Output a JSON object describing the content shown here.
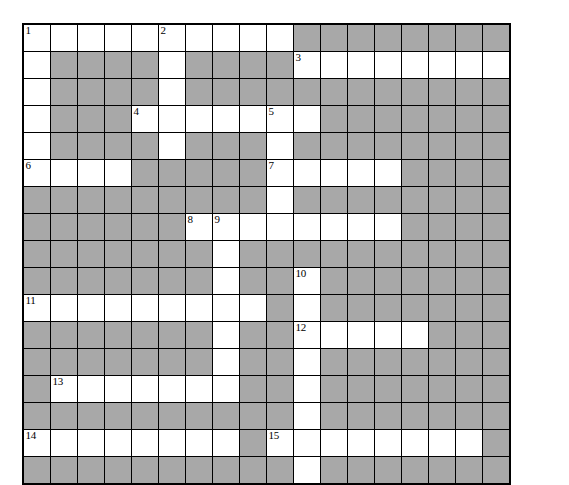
{
  "document": {
    "type": "crossword-puzzle-grid",
    "title": "Crossword Puzzle Grid"
  },
  "grid": {
    "columns": 18,
    "rows": 14,
    "cell_size_px": 28,
    "colors": {
      "empty_cell": "#ffffff",
      "block_cell": "#a8a8a8",
      "border": "#000000",
      "number_text": "#000000",
      "page_background": "#ffffff"
    },
    "legend": {
      "W": "white answer cell",
      "B": "shaded block cell"
    },
    "cells": [
      [
        "W",
        "W",
        "W",
        "W",
        "W",
        "W",
        "W",
        "W",
        "W",
        "W",
        "B",
        "B",
        "B",
        "B",
        "B",
        "B",
        "B",
        "B"
      ],
      [
        "W",
        "B",
        "B",
        "B",
        "B",
        "W",
        "B",
        "B",
        "B",
        "B",
        "W",
        "W",
        "W",
        "W",
        "W",
        "W",
        "W",
        "W"
      ],
      [
        "W",
        "B",
        "B",
        "B",
        "B",
        "W",
        "B",
        "B",
        "B",
        "B",
        "B",
        "B",
        "B",
        "B",
        "B",
        "B",
        "B",
        "B"
      ],
      [
        "W",
        "B",
        "B",
        "B",
        "W",
        "W",
        "W",
        "W",
        "W",
        "W",
        "W",
        "B",
        "B",
        "B",
        "B",
        "B",
        "B",
        "B"
      ],
      [
        "W",
        "B",
        "B",
        "B",
        "B",
        "W",
        "B",
        "B",
        "B",
        "W",
        "B",
        "B",
        "B",
        "B",
        "B",
        "B",
        "B",
        "B"
      ],
      [
        "W",
        "W",
        "W",
        "W",
        "B",
        "B",
        "B",
        "B",
        "B",
        "W",
        "W",
        "W",
        "W",
        "W",
        "B",
        "B",
        "B",
        "B"
      ],
      [
        "B",
        "B",
        "B",
        "B",
        "B",
        "B",
        "B",
        "B",
        "B",
        "W",
        "B",
        "B",
        "B",
        "B",
        "B",
        "B",
        "B",
        "B"
      ],
      [
        "B",
        "B",
        "B",
        "B",
        "B",
        "B",
        "W",
        "W",
        "W",
        "W",
        "W",
        "W",
        "W",
        "W",
        "B",
        "B",
        "B",
        "B"
      ],
      [
        "B",
        "B",
        "B",
        "B",
        "B",
        "B",
        "B",
        "W",
        "B",
        "B",
        "B",
        "B",
        "B",
        "B",
        "B",
        "B",
        "B",
        "B"
      ],
      [
        "B",
        "B",
        "B",
        "B",
        "B",
        "B",
        "B",
        "W",
        "B",
        "B",
        "W",
        "B",
        "B",
        "B",
        "B",
        "B",
        "B",
        "B"
      ],
      [
        "W",
        "W",
        "W",
        "W",
        "W",
        "W",
        "W",
        "W",
        "W",
        "B",
        "W",
        "B",
        "B",
        "B",
        "B",
        "B",
        "B",
        "B"
      ],
      [
        "B",
        "B",
        "B",
        "B",
        "B",
        "B",
        "B",
        "W",
        "B",
        "B",
        "W",
        "W",
        "W",
        "W",
        "W",
        "B",
        "B",
        "B"
      ],
      [
        "B",
        "B",
        "B",
        "B",
        "B",
        "B",
        "B",
        "W",
        "B",
        "B",
        "W",
        "B",
        "B",
        "B",
        "B",
        "B",
        "B",
        "B"
      ],
      [
        "B",
        "W",
        "W",
        "W",
        "W",
        "W",
        "W",
        "W",
        "B",
        "B",
        "W",
        "B",
        "B",
        "B",
        "B",
        "B",
        "B",
        "B"
      ],
      [
        "B",
        "B",
        "B",
        "B",
        "B",
        "B",
        "B",
        "B",
        "B",
        "B",
        "W",
        "B",
        "B",
        "B",
        "B",
        "B",
        "B",
        "B"
      ],
      [
        "W",
        "W",
        "W",
        "W",
        "W",
        "W",
        "W",
        "W",
        "B",
        "W",
        "W",
        "W",
        "W",
        "W",
        "W",
        "W",
        "W",
        "B"
      ],
      [
        "B",
        "B",
        "B",
        "B",
        "B",
        "B",
        "B",
        "B",
        "B",
        "B",
        "W",
        "B",
        "B",
        "B",
        "B",
        "B",
        "B",
        "B"
      ]
    ],
    "clue_numbers": [
      {
        "n": "1",
        "row": 1,
        "col": 1
      },
      {
        "n": "2",
        "row": 1,
        "col": 6
      },
      {
        "n": "3",
        "row": 2,
        "col": 11
      },
      {
        "n": "4",
        "row": 4,
        "col": 5
      },
      {
        "n": "5",
        "row": 4,
        "col": 10
      },
      {
        "n": "6",
        "row": 6,
        "col": 1
      },
      {
        "n": "7",
        "row": 6,
        "col": 10
      },
      {
        "n": "8",
        "row": 8,
        "col": 7
      },
      {
        "n": "9",
        "row": 8,
        "col": 8
      },
      {
        "n": "10",
        "row": 10,
        "col": 11
      },
      {
        "n": "11",
        "row": 11,
        "col": 1
      },
      {
        "n": "12",
        "row": 12,
        "col": 11
      },
      {
        "n": "13",
        "row": 14,
        "col": 2
      },
      {
        "n": "14",
        "row": 16,
        "col": 1
      },
      {
        "n": "15",
        "row": 16,
        "col": 10
      }
    ]
  }
}
